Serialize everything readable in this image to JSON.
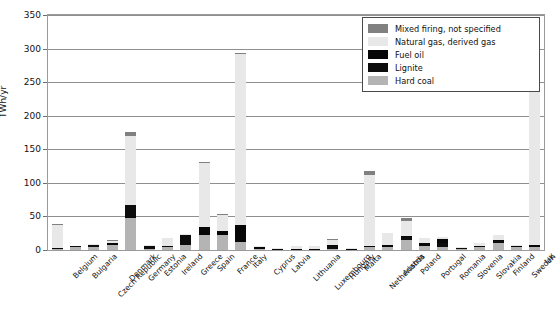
{
  "chart_data": {
    "type": "bar",
    "stacked": true,
    "title": "",
    "xlabel": "",
    "ylabel": "TWh/yr",
    "ylim": [
      0,
      350
    ],
    "yticks": [
      0,
      50,
      100,
      150,
      200,
      250,
      300,
      350
    ],
    "ytick_labels": [
      "0",
      "50",
      "100",
      "150",
      "200",
      "250",
      "300",
      "350"
    ],
    "grid": true,
    "legend_position": "top-right",
    "categories": [
      "Belgium",
      "Bulgaria",
      "Czech Republic",
      "Denmark",
      "Germany",
      "Estonia",
      "Ireland",
      "Greece",
      "Spain",
      "France",
      "Italy",
      "Cyprus",
      "Latvia",
      "Lithuania",
      "Luxembourg",
      "Hungary",
      "Malta",
      "Netherlands",
      "Austria",
      "Poland",
      "Portugal",
      "Romania",
      "Slovenia",
      "Slovakia",
      "Finland",
      "Sweden",
      "UK"
    ],
    "series": [
      {
        "name": "Hard coal",
        "color": "#b4b4b4",
        "values": [
          2,
          4,
          4,
          8,
          48,
          1,
          4,
          7,
          22,
          22,
          12,
          2,
          0,
          0,
          0,
          2,
          0,
          5,
          4,
          15,
          6,
          4,
          1,
          5,
          10,
          4,
          5
        ]
      },
      {
        "name": "Lignite",
        "color": "#0d0d0d",
        "values": [
          0,
          1,
          3,
          0,
          19,
          5,
          0,
          15,
          0,
          0,
          0,
          0,
          0,
          0,
          0,
          4,
          0,
          0,
          0,
          4,
          0,
          6,
          1,
          0,
          3,
          0,
          0
        ]
      },
      {
        "name": "Fuel oil",
        "color": "#070707",
        "values": [
          1,
          0,
          0,
          2,
          0,
          0,
          1,
          0,
          13,
          6,
          25,
          3,
          1,
          1,
          1,
          2,
          2,
          1,
          3,
          2,
          5,
          7,
          0,
          1,
          2,
          2,
          3
        ]
      },
      {
        "name": "Natural gas, derived gas",
        "color": "#e8e8e8",
        "values": [
          34,
          1,
          1,
          4,
          103,
          1,
          13,
          1,
          94,
          24,
          255,
          1,
          2,
          4,
          4,
          7,
          1,
          105,
          18,
          22,
          7,
          3,
          1,
          4,
          7,
          2,
          305
        ]
      },
      {
        "name": "Mixed firing, not specified",
        "color": "#808080",
        "values": [
          1,
          0,
          0,
          1,
          6,
          0,
          0,
          0,
          2,
          1,
          1,
          0,
          0,
          0,
          0,
          2,
          0,
          7,
          0,
          5,
          0,
          0,
          0,
          0,
          0,
          0,
          2
        ]
      }
    ],
    "totals": [
      38,
      6,
      8,
      15,
      176,
      7,
      18,
      23,
      131,
      53,
      293,
      6,
      3,
      5,
      5,
      17,
      3,
      118,
      25,
      48,
      18,
      20,
      3,
      10,
      22,
      8,
      315
    ]
  },
  "legend": {
    "items": [
      {
        "label": "Mixed firing, not specified",
        "swatch": "mixed"
      },
      {
        "label": "Natural gas, derived gas",
        "swatch": "gas"
      },
      {
        "label": "Fuel oil",
        "swatch": "fueloil"
      },
      {
        "label": "Lignite",
        "swatch": "lignite"
      },
      {
        "label": "Hard coal",
        "swatch": "hardcoal"
      }
    ]
  }
}
